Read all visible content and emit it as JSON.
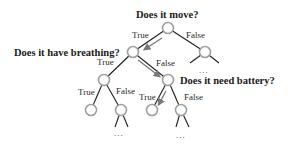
{
  "diagram": {
    "type": "decision-tree",
    "questions": {
      "root": "Does it move?",
      "left": "Does it have breathing?",
      "left_right": "Does it need battery?"
    },
    "edge_labels": {
      "true": "True",
      "false": "False"
    },
    "ellipsis": "...",
    "colors": {
      "node_stroke": "#a0a0a0",
      "edge": "#1e1e1e",
      "path_arrow": "#7a7a7a",
      "text": "#1a1a1a"
    },
    "decision_path": [
      "Does it move? → True",
      "Does it have breathing? → False",
      "Does it need battery? → True"
    ]
  }
}
